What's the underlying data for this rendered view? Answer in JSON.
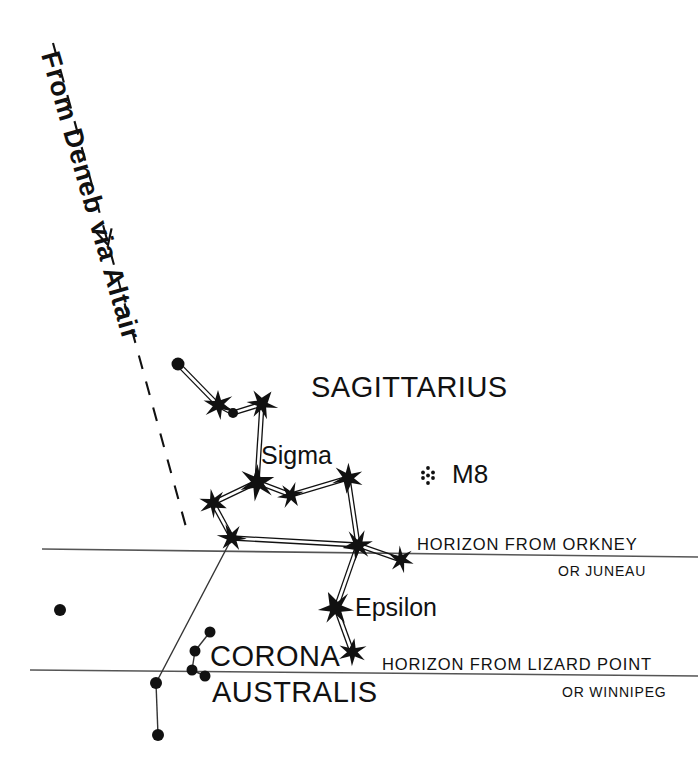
{
  "chart": {
    "title_visible": false,
    "background_color": "#ffffff",
    "ink_color": "#111111",
    "line_color": "#555555"
  },
  "annotations": {
    "route": {
      "text": "From  Deneb  via  Altair",
      "icon": "arrow-down-icon",
      "line_style": "dashed"
    },
    "constellation_sagittarius": "SAGITTARIUS",
    "constellation_corona_line1": "CORONA",
    "constellation_corona_line2": "AUSTRALIS",
    "star_sigma": "Sigma",
    "star_epsilon": "Epsilon",
    "deep_sky_m8": "M8",
    "horizon_upper_primary": "HORIZON FROM ORKNEY",
    "horizon_upper_secondary": "OR JUNEAU",
    "horizon_lower_primary": "HORIZON FROM LIZARD POINT",
    "horizon_lower_secondary": "OR WINNIPEG"
  },
  "chart_data": {
    "type": "scatter",
    "xlabel": "",
    "ylabel": "",
    "xlim": [
      0,
      698
    ],
    "ylim": [
      0,
      767
    ],
    "grid": false,
    "legend": "none",
    "stars": [
      {
        "id": "s1",
        "label": "",
        "x": 218,
        "y": 405,
        "kind": "big-star",
        "size": 15
      },
      {
        "id": "s2",
        "label": "",
        "x": 262,
        "y": 404,
        "kind": "big-star",
        "size": 15
      },
      {
        "id": "s3",
        "label": "Sigma",
        "x": 257,
        "y": 482,
        "kind": "big-star",
        "size": 18
      },
      {
        "id": "s4",
        "label": "",
        "x": 213,
        "y": 503,
        "kind": "big-star",
        "size": 14
      },
      {
        "id": "s5",
        "label": "",
        "x": 291,
        "y": 495,
        "kind": "big-star",
        "size": 13
      },
      {
        "id": "s6",
        "label": "",
        "x": 348,
        "y": 478,
        "kind": "big-star",
        "size": 15
      },
      {
        "id": "s7",
        "label": "",
        "x": 232,
        "y": 538,
        "kind": "big-star",
        "size": 14
      },
      {
        "id": "s8",
        "label": "",
        "x": 358,
        "y": 545,
        "kind": "big-star",
        "size": 15
      },
      {
        "id": "s9",
        "label": "",
        "x": 401,
        "y": 560,
        "kind": "big-star",
        "size": 13
      },
      {
        "id": "s10",
        "label": "Epsilon",
        "x": 336,
        "y": 608,
        "kind": "big-star",
        "size": 17
      },
      {
        "id": "s11",
        "label": "",
        "x": 352,
        "y": 652,
        "kind": "big-star",
        "size": 14
      }
    ],
    "dots": [
      {
        "id": "d1",
        "x": 178,
        "y": 364,
        "r": 6.5
      },
      {
        "id": "d2",
        "x": 233,
        "y": 413,
        "r": 5.0
      },
      {
        "id": "d3",
        "x": 60,
        "y": 610,
        "r": 6.0
      },
      {
        "id": "d4",
        "x": 156,
        "y": 683,
        "r": 6.0
      },
      {
        "id": "d5",
        "x": 158,
        "y": 735,
        "r": 6.0
      },
      {
        "id": "d6",
        "x": 210,
        "y": 632,
        "r": 5.5
      },
      {
        "id": "d7",
        "x": 195,
        "y": 651,
        "r": 5.5
      },
      {
        "id": "d8",
        "x": 192,
        "y": 670,
        "r": 5.5
      },
      {
        "id": "d9",
        "x": 205,
        "y": 676,
        "r": 5.5
      }
    ],
    "constellation_lines": [
      {
        "from": [
          178,
          364
        ],
        "to": [
          218,
          405
        ],
        "style": "double"
      },
      {
        "from": [
          218,
          405
        ],
        "to": [
          233,
          413
        ],
        "style": "double"
      },
      {
        "from": [
          233,
          413
        ],
        "to": [
          262,
          404
        ],
        "style": "double"
      },
      {
        "from": [
          262,
          404
        ],
        "to": [
          257,
          482
        ],
        "style": "double"
      },
      {
        "from": [
          257,
          482
        ],
        "to": [
          213,
          503
        ],
        "style": "double"
      },
      {
        "from": [
          257,
          482
        ],
        "to": [
          291,
          495
        ],
        "style": "double"
      },
      {
        "from": [
          291,
          495
        ],
        "to": [
          348,
          478
        ],
        "style": "double"
      },
      {
        "from": [
          348,
          478
        ],
        "to": [
          358,
          545
        ],
        "style": "double"
      },
      {
        "from": [
          213,
          503
        ],
        "to": [
          232,
          538
        ],
        "style": "double"
      },
      {
        "from": [
          232,
          538
        ],
        "to": [
          358,
          545
        ],
        "style": "double"
      },
      {
        "from": [
          358,
          545
        ],
        "to": [
          401,
          560
        ],
        "style": "double"
      },
      {
        "from": [
          358,
          545
        ],
        "to": [
          336,
          608
        ],
        "style": "double"
      },
      {
        "from": [
          336,
          608
        ],
        "to": [
          352,
          652
        ],
        "style": "double"
      },
      {
        "from": [
          232,
          538
        ],
        "to": [
          156,
          683
        ],
        "style": "single"
      },
      {
        "from": [
          156,
          683
        ],
        "to": [
          158,
          735
        ],
        "style": "single"
      },
      {
        "from": [
          210,
          632
        ],
        "to": [
          195,
          651
        ],
        "style": "single"
      },
      {
        "from": [
          195,
          651
        ],
        "to": [
          192,
          670
        ],
        "style": "single"
      },
      {
        "from": [
          192,
          670
        ],
        "to": [
          205,
          676
        ],
        "style": "single"
      }
    ],
    "horizon_lines": [
      {
        "id": "horizon-orkney",
        "from": [
          42,
          549
        ],
        "to": [
          698,
          557
        ]
      },
      {
        "id": "horizon-lizard",
        "from": [
          30,
          670
        ],
        "to": [
          698,
          676
        ]
      }
    ],
    "route_line": {
      "from": [
        53,
        43
      ],
      "to": [
        186,
        527
      ],
      "arrow_at": [
        108,
        245
      ],
      "dash": "14 13"
    },
    "deep_sky_objects": [
      {
        "id": "m8",
        "label": "M8",
        "x": 428,
        "y": 475,
        "symbol": "cluster-dots"
      }
    ]
  }
}
